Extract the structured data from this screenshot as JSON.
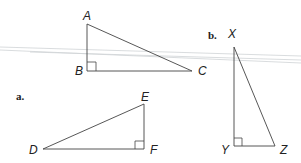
{
  "diagram": {
    "type": "right-triangles",
    "parts": [
      {
        "label": "a.",
        "triangles": [
          {
            "name": "ABC",
            "vertices": {
              "A": "A",
              "B": "B",
              "C": "C"
            },
            "right_angle_at": "B"
          },
          {
            "name": "DEF",
            "vertices": {
              "D": "D",
              "E": "E",
              "F": "F"
            },
            "right_angle_at": "F"
          }
        ]
      },
      {
        "label": "b.",
        "triangles": [
          {
            "name": "XYZ",
            "vertices": {
              "X": "X",
              "Y": "Y",
              "Z": "Z"
            },
            "right_angle_at": "Y"
          }
        ]
      }
    ]
  },
  "labels": {
    "part_a": "a.",
    "part_b": "b.",
    "A": "A",
    "B": "B",
    "C": "C",
    "D": "D",
    "E": "E",
    "F": "F",
    "X": "X",
    "Y": "Y",
    "Z": "Z"
  },
  "colors": {
    "line": "#444444",
    "background": "#ffffff",
    "scan_artifact": "#cfd3d6"
  }
}
